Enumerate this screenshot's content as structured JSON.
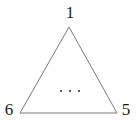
{
  "figure": {
    "type": "polygon-diagram",
    "shape": "triangle",
    "background_color": "#ffffff",
    "stroke_color": "#7a7a7a",
    "stroke_width": 1,
    "text_color": "#1a1a1a",
    "vertices": [
      {
        "id": "apex",
        "label": "1",
        "x": 69,
        "y": 27
      },
      {
        "id": "bottom-right",
        "label": "5",
        "x": 117,
        "y": 113
      },
      {
        "id": "bottom-left",
        "label": "6",
        "x": 20,
        "y": 113
      }
    ],
    "polygon_points": "69,27 117,113 20,113",
    "interior_annotation": {
      "name": "ellipsis",
      "text": "...",
      "dot_count": 3,
      "dot_color": "#262626"
    }
  }
}
